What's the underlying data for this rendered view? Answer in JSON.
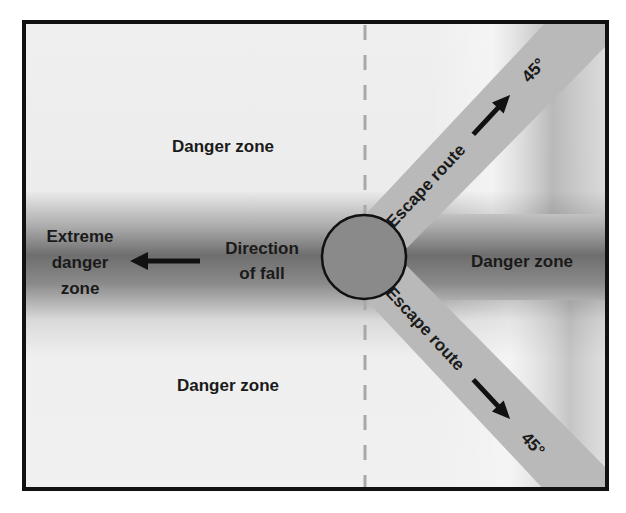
{
  "diagram": {
    "colors": {
      "frame": "#111111",
      "background_light": "#efefef",
      "band_dark": "#6a6a6a",
      "escape_route": "#b9b9b9",
      "stump_fill": "#8a8a8a",
      "dashed_line": "#a8a8a8",
      "text": "#1a1a1a"
    },
    "labels": {
      "danger_zone_top": "Danger zone",
      "danger_zone_bottom": "Danger zone",
      "danger_zone_right": "Danger zone",
      "extreme_line1": "Extreme",
      "extreme_line2": "danger",
      "extreme_line3": "zone",
      "direction_line1": "Direction",
      "direction_line2": "of fall",
      "escape_route_upper": "Escape route",
      "escape_route_lower": "Escape route",
      "angle_upper": "45°",
      "angle_lower": "45°"
    },
    "icons": {
      "fall_direction_arrow": "arrow-left",
      "escape_upper_arrow": "arrow-up-right",
      "escape_lower_arrow": "arrow-down-right",
      "tree_stump": "circle"
    }
  }
}
